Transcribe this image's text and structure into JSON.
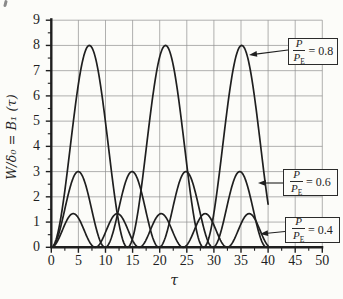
{
  "figure": {
    "background": "#fcfcf9"
  },
  "colors": {
    "curve": "#1f1f1f",
    "grid": "#8f8f8f",
    "axis": "#1f1f1f",
    "text": "#1f1f1f",
    "box_border": "#2b2b2b"
  },
  "chart_data": {
    "type": "line",
    "title": "",
    "xlabel": "τ",
    "ylabel": "W/δ₀ = B₁ (τ)",
    "xlim": [
      0,
      50
    ],
    "ylim": [
      0,
      9
    ],
    "x_ticks": [
      0,
      5,
      10,
      15,
      20,
      25,
      30,
      35,
      40,
      45,
      50
    ],
    "y_ticks": [
      0,
      1,
      2,
      3,
      4,
      5,
      6,
      7,
      8,
      9
    ],
    "x_minor_tick_step": 2.5,
    "y_minor_tick_step": 0.5,
    "grid": true,
    "legend_position": "right-callout-boxes",
    "tau_domain": [
      0,
      40
    ],
    "formula": "B1(τ) = (2r/(1−r))·sin²(√(1−r)·τ/2), where r = P/P_E",
    "series": [
      {
        "name": "P/P_E = 0.8",
        "ratio": 0.8,
        "amplitude": 8.0,
        "period": 14.05,
        "peaks_tau": [
          7.0,
          21.1,
          35.1
        ],
        "zeros_tau": [
          0,
          14.0,
          28.1
        ],
        "value_at_tau_40": 1.7
      },
      {
        "name": "P/P_E = 0.6",
        "ratio": 0.6,
        "amplitude": 3.0,
        "period": 9.93,
        "peaks_tau": [
          5.0,
          14.9,
          24.8,
          34.8
        ],
        "zeros_tau": [
          0,
          9.9,
          19.9,
          29.8,
          39.7
        ],
        "value_at_tau_40": 0.02
      },
      {
        "name": "P/P_E = 0.4",
        "ratio": 0.4,
        "amplitude": 1.33,
        "period": 8.11,
        "peaks_tau": [
          4.1,
          12.2,
          20.3,
          28.4,
          36.5
        ],
        "zeros_tau": [
          0,
          8.1,
          16.2,
          24.3,
          32.4
        ],
        "value_at_tau_40": 0.06
      }
    ]
  },
  "annotations": [
    {
      "num": "P",
      "den": "P",
      "den_sub": "E",
      "value": "= 0.8"
    },
    {
      "num": "P",
      "den": "P",
      "den_sub": "E",
      "value": "= 0.6"
    },
    {
      "num": "P",
      "den": "P",
      "den_sub": "E",
      "value": "= 0.4"
    }
  ]
}
